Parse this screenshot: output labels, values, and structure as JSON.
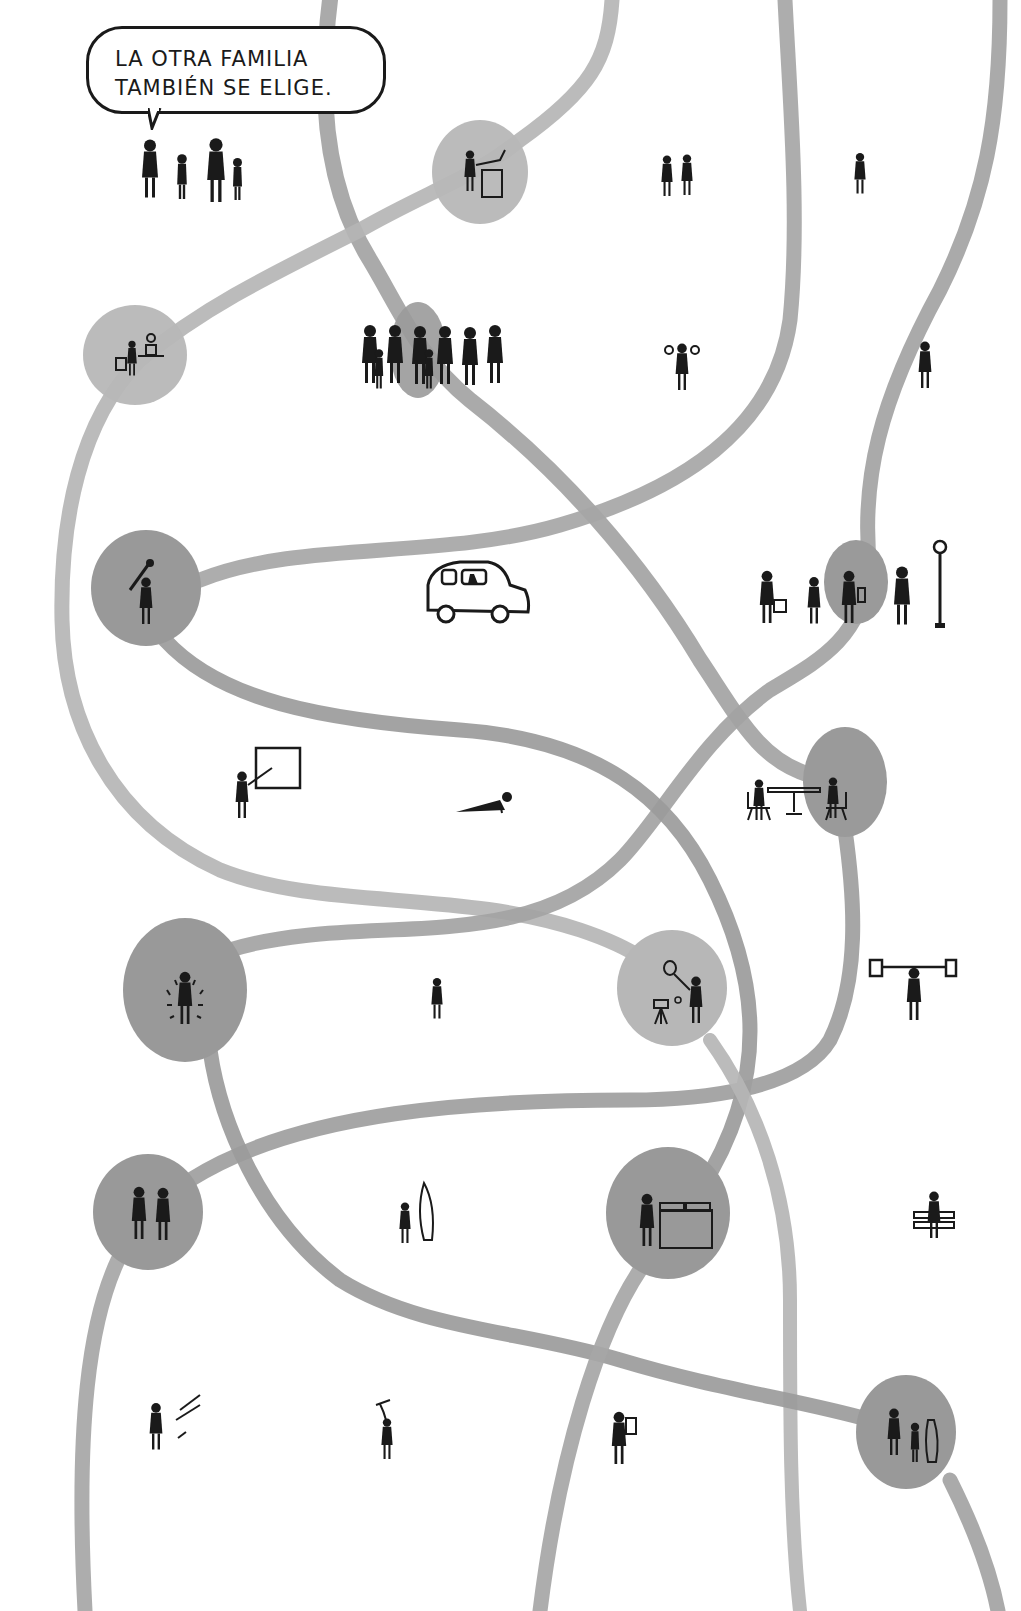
{
  "speech_bubble": {
    "line1": "LA OTRA FAMILIA",
    "line2": "TAMBIÉN SE ELIGE."
  },
  "colors": {
    "background": "#ffffff",
    "path_light": "#b4b4b4",
    "path_dark": "#9a9a9a",
    "node_light": "#b7b7b7",
    "node_dark": "#999999",
    "ink": "#1a1a1a"
  },
  "nodes": [
    {
      "id": "vending",
      "label": "person-at-machine",
      "x": 480,
      "y": 172,
      "rx": 48,
      "ry": 52,
      "tone": "light"
    },
    {
      "id": "gardening",
      "label": "person-watering-plant",
      "x": 135,
      "y": 355,
      "rx": 52,
      "ry": 50,
      "tone": "light"
    },
    {
      "id": "group",
      "label": "family-group",
      "x": 418,
      "y": 350,
      "rx": 28,
      "ry": 48,
      "tone": "dark"
    },
    {
      "id": "golf",
      "label": "person-with-club",
      "x": 146,
      "y": 588,
      "rx": 55,
      "ry": 58,
      "tone": "dark"
    },
    {
      "id": "bus-stop",
      "label": "people-waiting",
      "x": 856,
      "y": 582,
      "rx": 32,
      "ry": 42,
      "tone": "dark"
    },
    {
      "id": "cafe",
      "label": "two-at-table",
      "x": 845,
      "y": 782,
      "rx": 42,
      "ry": 55,
      "tone": "dark"
    },
    {
      "id": "spotlight",
      "label": "person-glowing",
      "x": 185,
      "y": 990,
      "rx": 62,
      "ry": 72,
      "tone": "dark"
    },
    {
      "id": "tennis",
      "label": "person-with-racket",
      "x": 672,
      "y": 988,
      "rx": 55,
      "ry": 58,
      "tone": "light"
    },
    {
      "id": "couple",
      "label": "couple-holding-hands",
      "x": 148,
      "y": 1212,
      "rx": 55,
      "ry": 58,
      "tone": "dark"
    },
    {
      "id": "laundry",
      "label": "person-at-washer",
      "x": 668,
      "y": 1213,
      "rx": 62,
      "ry": 66,
      "tone": "dark"
    },
    {
      "id": "trio",
      "label": "three-people",
      "x": 906,
      "y": 1432,
      "rx": 50,
      "ry": 57,
      "tone": "dark"
    }
  ],
  "free_figures": [
    {
      "id": "family",
      "label": "family-of-four",
      "x": 190,
      "y": 170
    },
    {
      "id": "pair-top",
      "label": "two-people",
      "x": 680,
      "y": 178
    },
    {
      "id": "single-top",
      "label": "single-person",
      "x": 862,
      "y": 172
    },
    {
      "id": "juggler",
      "label": "person-arms-raised",
      "x": 682,
      "y": 358
    },
    {
      "id": "waver",
      "label": "person-waving",
      "x": 922,
      "y": 362
    },
    {
      "id": "car",
      "label": "car-driver",
      "x": 472,
      "y": 590
    },
    {
      "id": "pole",
      "label": "bus-stop-pole",
      "x": 940,
      "y": 585
    },
    {
      "id": "teacher",
      "label": "person-at-board",
      "x": 262,
      "y": 780
    },
    {
      "id": "pushup",
      "label": "person-pushup",
      "x": 485,
      "y": 800
    },
    {
      "id": "standing",
      "label": "standing-person",
      "x": 437,
      "y": 995
    },
    {
      "id": "lifter",
      "label": "weightlifter",
      "x": 912,
      "y": 985
    },
    {
      "id": "surfer",
      "label": "person-with-surfboard",
      "x": 410,
      "y": 1210
    },
    {
      "id": "sitter",
      "label": "person-on-bench",
      "x": 930,
      "y": 1212
    },
    {
      "id": "slider",
      "label": "person-sliding",
      "x": 165,
      "y": 1415
    },
    {
      "id": "kite",
      "label": "person-with-kite",
      "x": 385,
      "y": 1420
    },
    {
      "id": "reader",
      "label": "person-reading",
      "x": 622,
      "y": 1425
    }
  ]
}
